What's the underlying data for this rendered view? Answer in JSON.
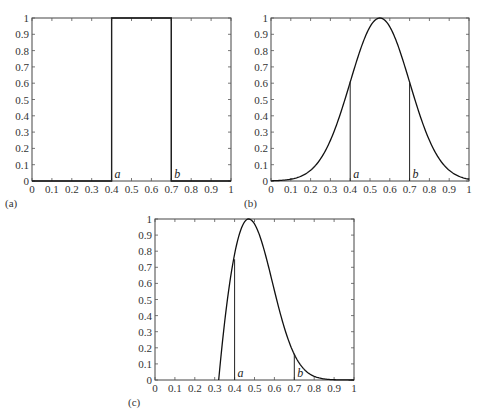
{
  "figure": {
    "panels": [
      {
        "id": "a",
        "label": "(a)"
      },
      {
        "id": "b",
        "label": "(b)"
      },
      {
        "id": "c",
        "label": "(c)"
      }
    ],
    "caption_fragment": ""
  },
  "chart_data": [
    {
      "panel": "(a)",
      "type": "line",
      "title": "",
      "xlabel": "",
      "ylabel": "",
      "xlim": [
        0,
        1
      ],
      "ylim": [
        0,
        1
      ],
      "xticks": [
        "0",
        "0.1",
        "0.2",
        "0.3",
        "0.4",
        "0.5",
        "0.6",
        "0.7",
        "0.8",
        "0.9",
        "1"
      ],
      "yticks": [
        "0",
        "0.1",
        "0.2",
        "0.3",
        "0.4",
        "0.5",
        "0.6",
        "0.7",
        "0.8",
        "0.9",
        "1"
      ],
      "grid": false,
      "series": [
        {
          "name": "rectangular membership",
          "shape": "rectangle",
          "x": [
            0,
            0.4,
            0.4,
            0.7,
            0.7,
            1
          ],
          "y": [
            0,
            0,
            1,
            1,
            0,
            0
          ]
        }
      ],
      "annotations": [
        {
          "text": "a",
          "x": 0.4,
          "line_to_y": 1
        },
        {
          "text": "b",
          "x": 0.7,
          "line_to_y": 1
        }
      ]
    },
    {
      "panel": "(b)",
      "type": "line",
      "title": "",
      "xlabel": "",
      "ylabel": "",
      "xlim": [
        0,
        1
      ],
      "ylim": [
        0,
        1
      ],
      "xticks": [
        "0",
        "0.1",
        "0.2",
        "0.3",
        "0.4",
        "0.5",
        "0.6",
        "0.7",
        "0.8",
        "0.9",
        "1"
      ],
      "yticks": [
        "0",
        "0.1",
        "0.2",
        "0.3",
        "0.4",
        "0.5",
        "0.6",
        "0.7",
        "0.8",
        "0.9",
        "1"
      ],
      "grid": false,
      "series": [
        {
          "name": "gaussian membership",
          "shape": "gaussian",
          "center": 0.55,
          "sigma": 0.15,
          "x": [
            0,
            0.1,
            0.2,
            0.3,
            0.4,
            0.5,
            0.55,
            0.6,
            0.7,
            0.8,
            0.9,
            1
          ],
          "y": [
            0.01,
            0.01,
            0.07,
            0.25,
            0.61,
            0.95,
            1.0,
            0.95,
            0.61,
            0.25,
            0.07,
            0.01
          ]
        }
      ],
      "annotations": [
        {
          "text": "a",
          "x": 0.4,
          "line_to_y": 0.61
        },
        {
          "text": "b",
          "x": 0.7,
          "line_to_y": 0.61
        }
      ]
    },
    {
      "panel": "(c)",
      "type": "line",
      "title": "",
      "xlabel": "",
      "ylabel": "",
      "xlim": [
        0,
        1
      ],
      "ylim": [
        0,
        1
      ],
      "xticks": [
        "0",
        "0.1",
        "0.2",
        "0.3",
        "0.4",
        "0.5",
        "0.6",
        "0.7",
        "0.8",
        "0.9",
        "1"
      ],
      "yticks": [
        "0",
        "0.1",
        "0.2",
        "0.3",
        "0.4",
        "0.5",
        "0.6",
        "0.7",
        "0.8",
        "0.9",
        "1"
      ],
      "grid": false,
      "series": [
        {
          "name": "skewed membership",
          "shape": "skewed",
          "start": 0.32,
          "peak": 0.47,
          "left_halfwidth": 0.15,
          "right_sigma": 0.12,
          "x": [
            0,
            0.32,
            0.4,
            0.47,
            0.5,
            0.6,
            0.7,
            0.8,
            0.9,
            1
          ],
          "y": [
            0,
            0,
            0.75,
            1.0,
            0.97,
            0.56,
            0.16,
            0.02,
            0.0,
            0.0
          ]
        }
      ],
      "annotations": [
        {
          "text": "a",
          "x": 0.4,
          "line_to_y": 0.75
        },
        {
          "text": "b",
          "x": 0.7,
          "line_to_y": 0.16
        }
      ]
    }
  ]
}
